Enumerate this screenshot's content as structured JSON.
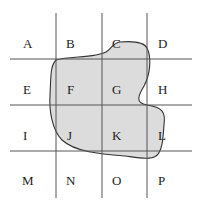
{
  "diagram": {
    "type": "grid-with-region",
    "rows": 4,
    "cols": 4,
    "labels": [
      [
        "A",
        "B",
        "C",
        "D"
      ],
      [
        "E",
        "F",
        "G",
        "H"
      ],
      [
        "I",
        "J",
        "K",
        "L"
      ],
      [
        "M",
        "N",
        "O",
        "P"
      ]
    ],
    "colors": {
      "region_fill": "#dcdcdc",
      "region_stroke": "#333333",
      "grid_line": "#555555"
    }
  }
}
